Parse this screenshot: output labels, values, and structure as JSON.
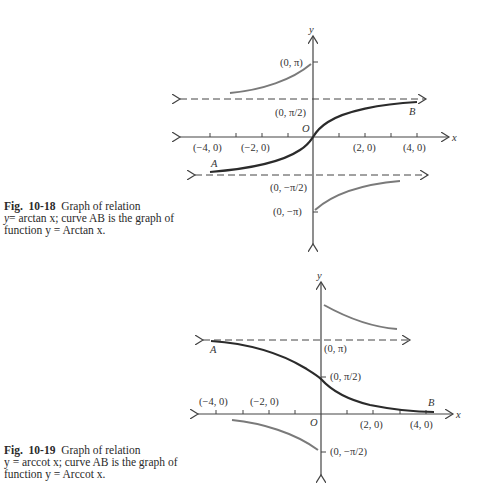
{
  "figure1": {
    "caption_fig": "Fig.",
    "caption_num": "10-18",
    "caption_line1": "Graph of relation",
    "caption_line2_prefix": "y",
    "caption_line2": "= arctan x; curve AB is the graph of",
    "caption_line3": "function y = Arctan x.",
    "labels": {
      "y_axis": "y",
      "x_axis": "x",
      "origin": "O",
      "point_A": "A",
      "point_B": "B",
      "pi": "(0, π)",
      "half_pi": "(0,  π/2)",
      "neg_half_pi": "(0, −π/2)",
      "neg_pi": "(0, −π)",
      "x_neg4": "(−4, 0)",
      "x_neg2": "(−2, 0)",
      "x_2": "(2, 0)",
      "x_4": "(4, 0)"
    }
  },
  "figure2": {
    "caption_fig": "Fig.",
    "caption_num": "10-19",
    "caption_line1": "Graph of relation",
    "caption_line2": "y = arccot x; curve AB is the graph of",
    "caption_line3": "function y = Arccot x.",
    "labels": {
      "y_axis": "y",
      "x_axis": "x",
      "origin": "O",
      "point_A": "A",
      "point_B": "B",
      "pi": "(0, π)",
      "half_pi": "(0, π/2)",
      "neg_half_pi": "(0, −π/2)",
      "x_neg4": "(−4, 0)",
      "x_neg2": "(−2, 0)",
      "x_2": "(2, 0)",
      "x_4": "(4, 0)"
    }
  },
  "colors": {
    "axis": "#444444",
    "principal_curve": "#2b2b2b",
    "other_branch": "#7a7a7a"
  }
}
